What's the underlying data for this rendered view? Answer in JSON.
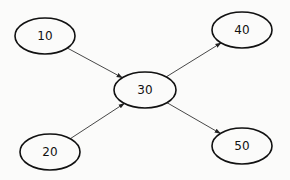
{
  "diagram": {
    "type": "directed-graph",
    "nodes": [
      {
        "id": "n10",
        "label": "10",
        "cx": 45,
        "cy": 36,
        "rx": 30,
        "ry": 18
      },
      {
        "id": "n30",
        "label": "30",
        "cx": 145,
        "cy": 90,
        "rx": 31,
        "ry": 18
      },
      {
        "id": "n40",
        "label": "40",
        "cx": 242,
        "cy": 30,
        "rx": 30,
        "ry": 18
      },
      {
        "id": "n20",
        "label": "20",
        "cx": 50,
        "cy": 152,
        "rx": 30,
        "ry": 18
      },
      {
        "id": "n50",
        "label": "50",
        "cx": 242,
        "cy": 146,
        "rx": 30,
        "ry": 18
      }
    ],
    "edges": [
      {
        "from": "n10",
        "to": "n30"
      },
      {
        "from": "n20",
        "to": "n30"
      },
      {
        "from": "n30",
        "to": "n40"
      },
      {
        "from": "n30",
        "to": "n50"
      }
    ]
  },
  "colors": {
    "background": "#fbfbfa",
    "stroke": "#111111",
    "edge": "#333333"
  }
}
